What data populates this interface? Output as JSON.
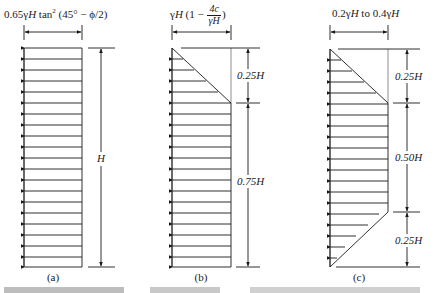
{
  "figure": {
    "panels": [
      {
        "id": "a",
        "caption": "(a)",
        "top_label": {
          "prefix": "0.65γ",
          "H": "H",
          "rest": " tan",
          "sup": "2",
          "tail": " (45° − ϕ/2)"
        },
        "pressure_shape": "rectangle",
        "dimensions": [
          {
            "label": "H",
            "fraction": 1.0
          }
        ]
      },
      {
        "id": "b",
        "caption": "(b)",
        "top_label": {
          "prefix": "γ",
          "H": "H",
          "open": " (1 − ",
          "frac_num": "4c",
          "frac_den": "γH",
          "close": ")"
        },
        "pressure_shape": "triangle-top-then-rectangle",
        "dimensions": [
          {
            "label": "0.25H",
            "fraction": 0.25
          },
          {
            "label": "0.75H",
            "fraction": 0.75
          }
        ]
      },
      {
        "id": "c",
        "caption": "(c)",
        "top_label": {
          "text1": "0.2γ",
          "H1": "H",
          "mid": " to 0.4γ",
          "H2": "H"
        },
        "pressure_shape": "trapezoid",
        "dimensions": [
          {
            "label": "0.25H",
            "fraction": 0.25
          },
          {
            "label": "0.50H",
            "fraction": 0.5
          },
          {
            "label": "0.25H",
            "fraction": 0.25
          }
        ]
      }
    ],
    "colors": {
      "line": "#1a1a1a",
      "background": "#ffffff"
    }
  }
}
